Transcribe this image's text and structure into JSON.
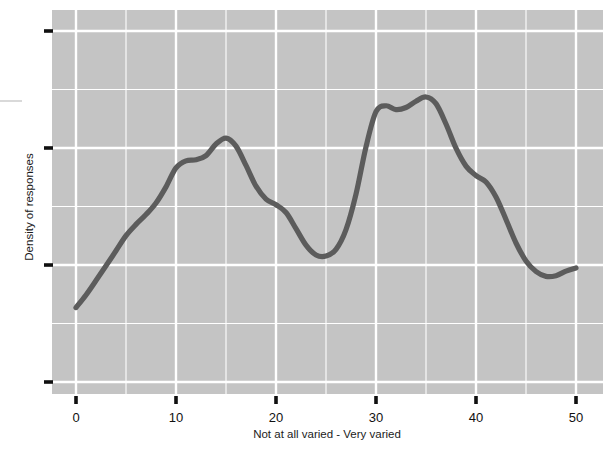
{
  "chart_data": {
    "type": "line",
    "title": "",
    "subtitle": "",
    "xlabel": "Not at all varied - Very varied",
    "ylabel": "Density of responses",
    "xlim": [
      -2,
      52.5
    ],
    "ylim": [
      0,
      1
    ],
    "xticks": [
      0,
      10,
      20,
      30,
      40,
      50
    ],
    "xticklabels": [
      "0",
      "10",
      "20",
      "30",
      "40",
      "50"
    ],
    "yticks": [
      0.0,
      0.3333,
      0.6667,
      1.0
    ],
    "yticklabels": [
      "",
      "",
      "",
      ""
    ],
    "x_minor_gridlines": [
      5,
      15,
      25,
      35,
      45
    ],
    "y_minor_gridlines": [
      0.1667,
      0.5,
      0.8333
    ],
    "grid": true,
    "legend": null,
    "legend_position": "none",
    "series": [
      {
        "name": "Density of responses",
        "color": "#5c5c5c",
        "x": [
          0,
          1,
          2,
          3,
          4,
          5,
          6,
          7,
          8,
          9,
          10,
          11,
          12,
          13,
          14,
          15,
          16,
          17,
          18,
          19,
          20,
          21,
          22,
          23,
          24,
          25,
          26,
          27,
          28,
          29,
          30,
          31,
          32,
          33,
          34,
          35,
          36,
          37,
          38,
          39,
          40,
          41,
          42,
          43,
          44,
          45,
          46,
          47,
          48,
          49,
          50
        ],
        "y": [
          0.212,
          0.248,
          0.289,
          0.331,
          0.374,
          0.417,
          0.449,
          0.477,
          0.51,
          0.556,
          0.61,
          0.63,
          0.633,
          0.645,
          0.678,
          0.695,
          0.672,
          0.617,
          0.558,
          0.521,
          0.505,
          0.483,
          0.437,
          0.39,
          0.362,
          0.359,
          0.378,
          0.434,
          0.535,
          0.67,
          0.77,
          0.787,
          0.776,
          0.782,
          0.8,
          0.812,
          0.793,
          0.735,
          0.666,
          0.615,
          0.588,
          0.57,
          0.527,
          0.463,
          0.396,
          0.345,
          0.315,
          0.301,
          0.303,
          0.316,
          0.325
        ]
      }
    ],
    "annotations": []
  },
  "axes": {
    "x_axis_title": "Not at all varied - Very varied",
    "y_axis_title": "Density of responses",
    "x_tick_labels": [
      "0",
      "10",
      "20",
      "30",
      "40",
      "50"
    ],
    "panel_background_color": "#c4c4c4",
    "gridline_color": "#ffffff",
    "line_color": "#5c5c5c",
    "tick_color": "#101010"
  }
}
